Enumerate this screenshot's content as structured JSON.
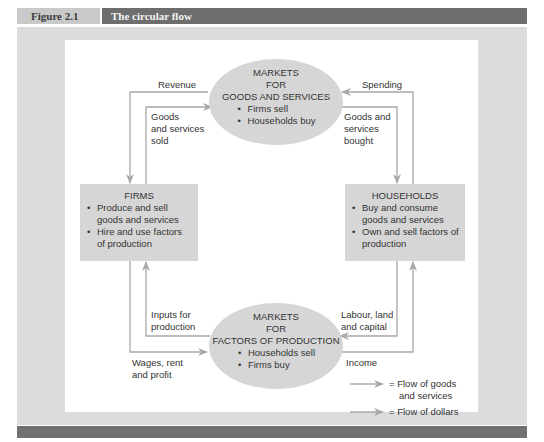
{
  "header": {
    "figure_label": "Figure 2.1",
    "figure_title": "The circular flow"
  },
  "nodes": {
    "goods_market": {
      "title_lines": [
        "MARKETS",
        "FOR",
        "GOODS AND SERVICES"
      ],
      "bullets": [
        "Firms sell",
        "Households buy"
      ]
    },
    "factor_market": {
      "title_lines": [
        "MARKETS",
        "FOR",
        "FACTORS OF PRODUCTION"
      ],
      "bullets": [
        "Households sell",
        "Firms buy"
      ]
    },
    "firms": {
      "title": "FIRMS",
      "bullets": [
        "Produce and sell goods and services",
        "Hire and use factors of production"
      ]
    },
    "households": {
      "title": "HOUSEHOLDS",
      "bullets": [
        "Buy and consume goods and services",
        "Own and sell factors of production"
      ]
    }
  },
  "flow_labels": {
    "revenue": "Revenue",
    "spending": "Spending",
    "goods_sold": [
      "Goods",
      "and services",
      "sold"
    ],
    "goods_bought": [
      "Goods and",
      "services",
      "bought"
    ],
    "inputs": [
      "Inputs for",
      "production"
    ],
    "labour": [
      "Labour, land",
      "and capital"
    ],
    "wages": [
      "Wages, rent",
      "and profit"
    ],
    "income": "Income"
  },
  "legend": {
    "goods_flow": [
      "= Flow of goods",
      "and services"
    ],
    "dollar_flow": "= Flow of dollars"
  },
  "colors": {
    "flow_line": "#a8a8a8",
    "node_fill": "#d6d6d6",
    "header_dark": "#6e6e6e",
    "header_light": "#c9c9c9"
  }
}
